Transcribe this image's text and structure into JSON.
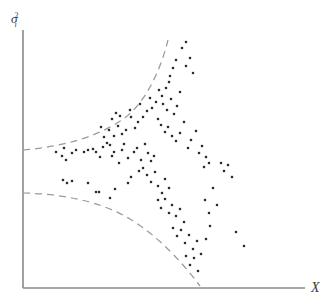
{
  "figure": {
    "title": "",
    "background_color": "#ffffff"
  },
  "axes": {
    "y_axis_label": "σ",
    "y_axis_superscript": "2",
    "y_axis_subscript": "i",
    "x_axis_label": "X",
    "axis_color": "#8a8a8a",
    "origin_x": 23,
    "origin_y": 288,
    "y_axis_top": 30,
    "x_axis_right": 305
  },
  "chart_data": {
    "type": "scatter",
    "title": "",
    "xlabel": "X",
    "ylabel": "σ²ᵢ",
    "xlim": [
      0,
      331
    ],
    "ylim": [
      0,
      307
    ],
    "grid": false,
    "legend": "none",
    "annotation": "Dashed envelope curves diverge as X increases, illustrating heteroskedastic error variance",
    "point_color": "#2b2b2b",
    "point_size": 2.3,
    "n_points": 128,
    "points": [
      [
        56,
        152
      ],
      [
        62,
        156
      ],
      [
        64,
        148
      ],
      [
        66,
        160
      ],
      [
        72,
        153
      ],
      [
        76,
        150
      ],
      [
        84,
        152
      ],
      [
        88,
        150
      ],
      [
        93,
        149
      ],
      [
        96,
        152
      ],
      [
        100,
        157
      ],
      [
        103,
        147
      ],
      [
        63,
        180
      ],
      [
        67,
        183
      ],
      [
        72,
        181
      ],
      [
        88,
        183
      ],
      [
        107,
        143
      ],
      [
        110,
        145
      ],
      [
        112,
        156
      ],
      [
        114,
        152
      ],
      [
        119,
        163
      ],
      [
        122,
        150
      ],
      [
        124,
        144
      ],
      [
        128,
        158
      ],
      [
        96,
        192
      ],
      [
        99,
        192
      ],
      [
        110,
        198
      ],
      [
        115,
        189
      ],
      [
        128,
        183
      ],
      [
        131,
        177
      ],
      [
        134,
        152
      ],
      [
        137,
        148
      ],
      [
        139,
        171
      ],
      [
        141,
        160
      ],
      [
        135,
        128
      ],
      [
        138,
        122
      ],
      [
        131,
        117
      ],
      [
        126,
        130
      ],
      [
        122,
        134
      ],
      [
        118,
        126
      ],
      [
        114,
        136
      ],
      [
        109,
        130
      ],
      [
        104,
        137
      ],
      [
        101,
        127
      ],
      [
        112,
        119
      ],
      [
        116,
        113
      ],
      [
        120,
        116
      ],
      [
        130,
        110
      ],
      [
        140,
        104
      ],
      [
        143,
        117
      ],
      [
        147,
        111
      ],
      [
        150,
        98
      ],
      [
        152,
        108
      ],
      [
        156,
        102
      ],
      [
        159,
        90
      ],
      [
        162,
        96
      ],
      [
        166,
        88
      ],
      [
        169,
        82
      ],
      [
        163,
        104
      ],
      [
        167,
        110
      ],
      [
        171,
        99
      ],
      [
        174,
        114
      ],
      [
        177,
        106
      ],
      [
        180,
        92
      ],
      [
        170,
        76
      ],
      [
        173,
        68
      ],
      [
        176,
        60
      ],
      [
        182,
        48
      ],
      [
        186,
        66
      ],
      [
        190,
        58
      ],
      [
        193,
        73
      ],
      [
        186,
        42
      ],
      [
        158,
        119
      ],
      [
        161,
        125
      ],
      [
        165,
        132
      ],
      [
        168,
        127
      ],
      [
        172,
        136
      ],
      [
        176,
        141
      ],
      [
        180,
        133
      ],
      [
        184,
        122
      ],
      [
        188,
        148
      ],
      [
        191,
        140
      ],
      [
        196,
        131
      ],
      [
        199,
        153
      ],
      [
        202,
        146
      ],
      [
        206,
        157
      ],
      [
        209,
        163
      ],
      [
        204,
        167
      ],
      [
        145,
        144
      ],
      [
        148,
        153
      ],
      [
        151,
        161
      ],
      [
        154,
        156
      ],
      [
        143,
        168
      ],
      [
        147,
        175
      ],
      [
        151,
        182
      ],
      [
        155,
        172
      ],
      [
        158,
        186
      ],
      [
        162,
        193
      ],
      [
        165,
        179
      ],
      [
        169,
        188
      ],
      [
        158,
        200
      ],
      [
        161,
        208
      ],
      [
        165,
        199
      ],
      [
        169,
        213
      ],
      [
        172,
        205
      ],
      [
        176,
        216
      ],
      [
        180,
        209
      ],
      [
        184,
        222
      ],
      [
        173,
        228
      ],
      [
        177,
        236
      ],
      [
        181,
        230
      ],
      [
        185,
        243
      ],
      [
        189,
        235
      ],
      [
        193,
        249
      ],
      [
        197,
        241
      ],
      [
        201,
        254
      ],
      [
        186,
        256
      ],
      [
        190,
        265
      ],
      [
        194,
        258
      ],
      [
        198,
        271
      ],
      [
        205,
        200
      ],
      [
        209,
        213
      ],
      [
        213,
        188
      ],
      [
        217,
        205
      ],
      [
        221,
        163
      ],
      [
        224,
        171
      ],
      [
        228,
        165
      ],
      [
        232,
        177
      ],
      [
        236,
        232
      ],
      [
        244,
        246
      ],
      [
        206,
        239
      ],
      [
        210,
        226
      ]
    ],
    "envelopes": [
      {
        "name": "upper-envelope",
        "style": "dashed",
        "color": "#9a9a9a",
        "path": "M 23,150 C 60,147 95,138 122,120 C 145,104 160,72 168,40"
      },
      {
        "name": "lower-envelope",
        "style": "dashed",
        "color": "#9a9a9a",
        "path": "M 23,193 C 62,194 100,201 130,219 C 158,236 182,262 200,286"
      }
    ]
  }
}
